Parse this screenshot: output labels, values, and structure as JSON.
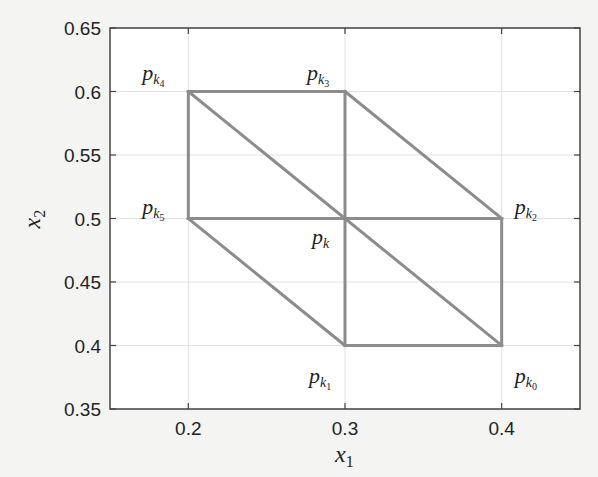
{
  "chart_data": {
    "type": "line",
    "title": "",
    "xlabel": "x1",
    "ylabel": "x2",
    "xlim": [
      0.15,
      0.45
    ],
    "ylim": [
      0.35,
      0.65
    ],
    "grid": true,
    "legend": null,
    "xticks": [
      0.2,
      0.3,
      0.4
    ],
    "xtick_labels": [
      "0.2",
      "0.3",
      "0.4"
    ],
    "yticks": [
      0.35,
      0.4,
      0.45,
      0.5,
      0.55,
      0.6,
      0.65
    ],
    "ytick_labels": [
      "0.35",
      "0.4",
      "0.45",
      "0.5",
      "0.55",
      "0.6",
      "0.65"
    ],
    "line_color": "#8c8c8c",
    "points": [
      {
        "name": "p_k",
        "label": "p",
        "sub": "k",
        "subsub": "",
        "x": 0.3,
        "y": 0.5
      },
      {
        "name": "p_k0",
        "label": "p",
        "sub": "k",
        "subsub": "0",
        "x": 0.4,
        "y": 0.4
      },
      {
        "name": "p_k1",
        "label": "p",
        "sub": "k",
        "subsub": "1",
        "x": 0.3,
        "y": 0.4
      },
      {
        "name": "p_k2",
        "label": "p",
        "sub": "k",
        "subsub": "2",
        "x": 0.4,
        "y": 0.5
      },
      {
        "name": "p_k3",
        "label": "p",
        "sub": "k",
        "subsub": "3",
        "x": 0.3,
        "y": 0.6
      },
      {
        "name": "p_k4",
        "label": "p",
        "sub": "k",
        "subsub": "4",
        "x": 0.2,
        "y": 0.6
      },
      {
        "name": "p_k5",
        "label": "p",
        "sub": "k",
        "subsub": "5",
        "x": 0.2,
        "y": 0.5
      }
    ],
    "segments": [
      [
        [
          0.2,
          0.6
        ],
        [
          0.3,
          0.6
        ]
      ],
      [
        [
          0.3,
          0.6
        ],
        [
          0.4,
          0.5
        ]
      ],
      [
        [
          0.4,
          0.5
        ],
        [
          0.4,
          0.4
        ]
      ],
      [
        [
          0.4,
          0.4
        ],
        [
          0.3,
          0.4
        ]
      ],
      [
        [
          0.3,
          0.4
        ],
        [
          0.2,
          0.5
        ]
      ],
      [
        [
          0.2,
          0.5
        ],
        [
          0.2,
          0.6
        ]
      ],
      [
        [
          0.2,
          0.6
        ],
        [
          0.4,
          0.4
        ]
      ],
      [
        [
          0.3,
          0.6
        ],
        [
          0.3,
          0.4
        ]
      ],
      [
        [
          0.2,
          0.5
        ],
        [
          0.4,
          0.5
        ]
      ]
    ]
  }
}
